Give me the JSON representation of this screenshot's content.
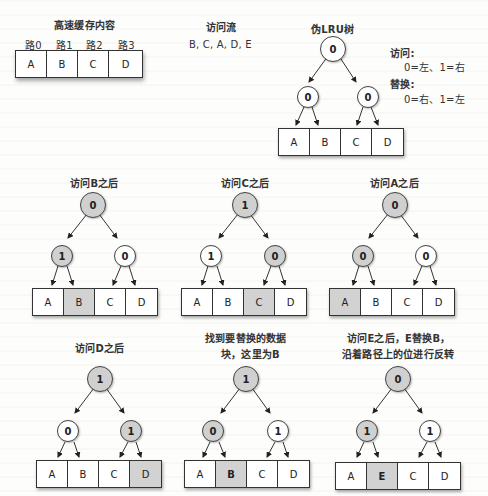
{
  "header": {
    "cache_title": "高速缓存内容",
    "ways": [
      "路0",
      "路1",
      "路2",
      "路3"
    ],
    "cache_cells": [
      "A",
      "B",
      "C",
      "D"
    ],
    "access_stream_title": "访问流",
    "access_stream": "B, C, A, D, E",
    "tree_title": "伪LRU树",
    "legend": {
      "access_label": "访问:",
      "access_rule": "0=左、1=右",
      "replace_label": "替换:",
      "replace_rule": "0=右、1=左"
    }
  },
  "colors": {
    "highlight": "#d2d2d2",
    "node_gray": "#d0d0d0",
    "border": "#333333"
  },
  "panels": [
    {
      "id": "initial",
      "title": "伪LRU树",
      "root": {
        "value": "0",
        "gray": false
      },
      "left": {
        "value": "0",
        "gray": false
      },
      "right": {
        "value": "0",
        "gray": false
      },
      "cells": [
        {
          "v": "A",
          "hl": false
        },
        {
          "v": "B",
          "hl": false
        },
        {
          "v": "C",
          "hl": false
        },
        {
          "v": "D",
          "hl": false
        }
      ]
    },
    {
      "id": "after-b",
      "title": "访问B之后",
      "root": {
        "value": "0",
        "gray": true
      },
      "left": {
        "value": "1",
        "gray": true
      },
      "right": {
        "value": "0",
        "gray": false
      },
      "cells": [
        {
          "v": "A",
          "hl": false
        },
        {
          "v": "B",
          "hl": true
        },
        {
          "v": "C",
          "hl": false
        },
        {
          "v": "D",
          "hl": false
        }
      ]
    },
    {
      "id": "after-c",
      "title": "访问C之后",
      "root": {
        "value": "1",
        "gray": true
      },
      "left": {
        "value": "1",
        "gray": false
      },
      "right": {
        "value": "0",
        "gray": true
      },
      "cells": [
        {
          "v": "A",
          "hl": false
        },
        {
          "v": "B",
          "hl": false
        },
        {
          "v": "C",
          "hl": true
        },
        {
          "v": "D",
          "hl": false
        }
      ]
    },
    {
      "id": "after-a",
      "title": "访问A之后",
      "root": {
        "value": "0",
        "gray": true
      },
      "left": {
        "value": "0",
        "gray": true
      },
      "right": {
        "value": "0",
        "gray": false
      },
      "cells": [
        {
          "v": "A",
          "hl": true
        },
        {
          "v": "B",
          "hl": false
        },
        {
          "v": "C",
          "hl": false
        },
        {
          "v": "D",
          "hl": false
        }
      ]
    },
    {
      "id": "after-d",
      "title": "访问D之后",
      "root": {
        "value": "1",
        "gray": true
      },
      "left": {
        "value": "0",
        "gray": false
      },
      "right": {
        "value": "1",
        "gray": true
      },
      "cells": [
        {
          "v": "A",
          "hl": false
        },
        {
          "v": "B",
          "hl": false
        },
        {
          "v": "C",
          "hl": false
        },
        {
          "v": "D",
          "hl": true
        }
      ]
    },
    {
      "id": "find-victim",
      "title_line1": "找到要替换的数据",
      "title_line2": "块，这里为B",
      "root": {
        "value": "1",
        "gray": true
      },
      "left": {
        "value": "0",
        "gray": true
      },
      "right": {
        "value": "1",
        "gray": false
      },
      "cells": [
        {
          "v": "A",
          "hl": false
        },
        {
          "v": "B",
          "hl": true,
          "bold": true
        },
        {
          "v": "C",
          "hl": false
        },
        {
          "v": "D",
          "hl": false
        }
      ]
    },
    {
      "id": "after-e",
      "title_line1": "访问E之后，E替换B，",
      "title_line2": "沿着路径上的位进行反转",
      "root": {
        "value": "0",
        "gray": true
      },
      "left": {
        "value": "1",
        "gray": true
      },
      "right": {
        "value": "1",
        "gray": false
      },
      "cells": [
        {
          "v": "A",
          "hl": false
        },
        {
          "v": "E",
          "hl": true,
          "bold": true
        },
        {
          "v": "C",
          "hl": false
        },
        {
          "v": "D",
          "hl": false
        }
      ]
    }
  ]
}
